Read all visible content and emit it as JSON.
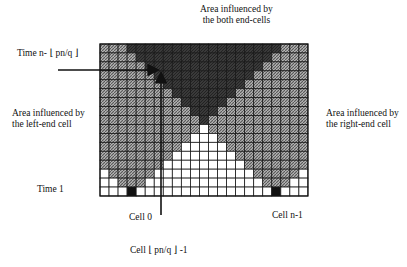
{
  "labels": {
    "top_line1": "Area influenced by",
    "top_line2": "the both end-cells",
    "time_top": "Time n- ⌊ pn/q ⌋",
    "left_line1": "Area influenced by",
    "left_line2": "the left-end cell",
    "right_line1": "Area influenced by",
    "right_line2": "the right-end cell",
    "time_bottom": "Time 1",
    "cell0": "Cell 0",
    "cell_mid": "Cell ⌊ pn/q ⌋ -1",
    "cell_last": "Cell n-1"
  },
  "grid": {
    "cols": 23,
    "rows": 17,
    "x": 100,
    "y": 44,
    "cell_w": 9.04,
    "cell_h": 8.94,
    "left_source_col": 3,
    "right_source_col": 19,
    "colors": {
      "hatch": "#8a8a8a",
      "both": "#3a3a3a",
      "empty": "#ffffff",
      "source": "#111111",
      "line": "#1a1a1a"
    }
  },
  "arrows": {
    "horizontal": {
      "x1": 58,
      "y": 70,
      "x2": 157
    },
    "vertical": {
      "x": 161,
      "y1": 215,
      "y2": 74
    }
  }
}
